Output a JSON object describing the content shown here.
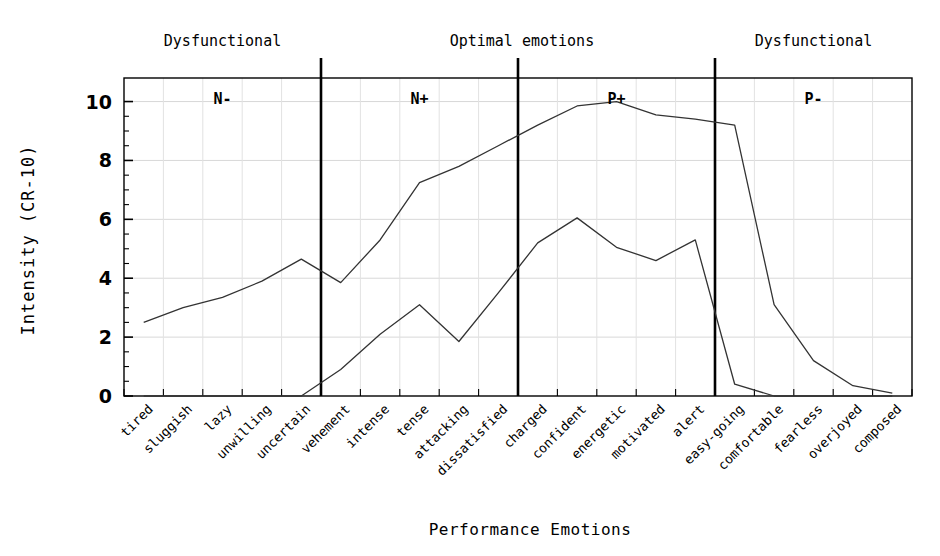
{
  "chart_data": {
    "type": "line",
    "title": "",
    "xlabel": "Performance Emotions",
    "ylabel": "Intensity (CR-10)",
    "ylim": [
      0,
      10.8
    ],
    "yticks": [
      0,
      2,
      4,
      6,
      8,
      10
    ],
    "ytick_labels": [
      "0",
      "2",
      "4",
      "6",
      "8",
      "10"
    ],
    "grid": true,
    "legend": "none",
    "categories": [
      "tired",
      "sluggish",
      "lazy",
      "unwilling",
      "uncertain",
      "vehement",
      "intense",
      "tense",
      "attacking",
      "dissatisfied",
      "charged",
      "confident",
      "energetic",
      "motivated",
      "alert",
      "easy-going",
      "comfortable",
      "fearless",
      "overjoyed",
      "composed"
    ],
    "series": [
      {
        "name": "upper",
        "values": [
          2.5,
          3.0,
          3.35,
          3.9,
          4.65,
          3.85,
          5.3,
          7.25,
          7.8,
          8.5,
          9.2,
          9.85,
          10.0,
          9.55,
          9.4,
          9.2,
          3.1,
          1.2,
          0.35,
          0.1
        ]
      },
      {
        "name": "lower",
        "values": [
          0,
          0,
          0,
          0,
          0,
          0.9,
          2.1,
          3.1,
          1.85,
          3.5,
          5.2,
          6.05,
          5.05,
          4.6,
          5.3,
          0.4,
          0,
          0,
          0,
          0
        ]
      }
    ],
    "zones": [
      {
        "code": "N-",
        "header": "Dysfunctional",
        "start": 0,
        "end": 4
      },
      {
        "code": "N+",
        "header": "Optimal emotions",
        "start": 5,
        "end": 9
      },
      {
        "code": "P+",
        "header": "",
        "start": 10,
        "end": 14
      },
      {
        "code": "P-",
        "header": "Dysfunctional",
        "start": 15,
        "end": 19
      }
    ],
    "zone_headers": [
      {
        "text": "Dysfunctional",
        "x_index": 2
      },
      {
        "text": "Optimal emotions",
        "x_index": 9.6
      },
      {
        "text": "Dysfunctional",
        "x_index": 17
      }
    ],
    "zone_codes": [
      "N-",
      "N+",
      "P+",
      "P-"
    ],
    "dividers": [
      4.5,
      9.5,
      14.5
    ]
  },
  "axes": {
    "y_axis_title": "Intensity (CR-10)",
    "x_axis_title": "Performance Emotions"
  }
}
